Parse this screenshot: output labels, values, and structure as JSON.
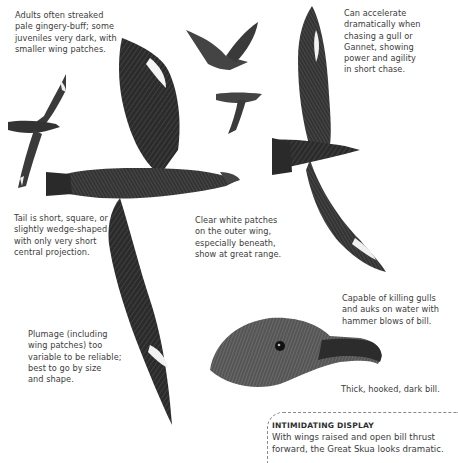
{
  "annotations": {
    "adults": [
      "Adults often streaked",
      "pale gingery-buff; some",
      "juveniles very dark, with",
      "smaller wing patches."
    ],
    "accelerate": [
      "Can accelerate",
      "dramatically when",
      "chasing a gull or",
      "Gannet, showing",
      "power and agility",
      "in short chase."
    ],
    "tail": [
      "Tail is short, square, or",
      "slightly wedge-shaped",
      "with only very short",
      "central projection."
    ],
    "white_patches": [
      "Clear white patches",
      "on the outer wing,",
      "especially beneath,",
      "show at great range."
    ],
    "killing": [
      "Capable of killing gulls",
      "and auks on water with",
      "hammer blows of bill."
    ],
    "plumage": [
      "Plumage (including",
      "wing patches) too",
      "variable to be reliable;",
      "best to go by size",
      "and shape."
    ],
    "bill": "Thick, hooked, dark bill."
  },
  "callout": {
    "title": "INTIMIDATING DISPLAY",
    "body": [
      "With wings raised and open bill thrust",
      "forward, the Great Skua looks dramatic."
    ]
  },
  "illustrations": {
    "main": "great-skua-underside-flight",
    "upper_right": "great-skua-upperside-flight",
    "left_small": "juvenile-skua-flight",
    "top_small_1": "skua-distant-flight",
    "top_small_2": "skua-distant-flight-2",
    "head": "great-skua-head-profile"
  }
}
